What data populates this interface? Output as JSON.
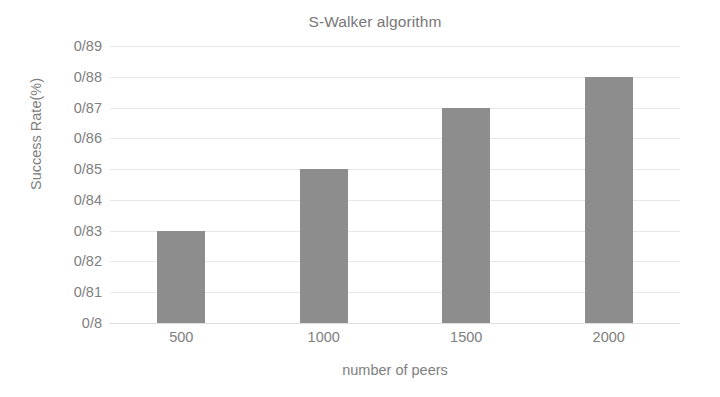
{
  "chart_data": {
    "type": "bar",
    "title": "S-Walker algorithm",
    "xlabel": "number of peers",
    "ylabel": "Success Rate(%)",
    "categories": [
      "500",
      "1000",
      "1500",
      "2000"
    ],
    "values": [
      0.83,
      0.85,
      0.87,
      0.88
    ],
    "value_labels": [
      "0/83",
      "0/85",
      "0/87",
      "0/88"
    ],
    "ylim": [
      0.8,
      0.89
    ],
    "ytick_values": [
      0.89,
      0.88,
      0.87,
      0.86,
      0.85,
      0.84,
      0.83,
      0.82,
      0.81,
      0.8
    ],
    "ytick_labels": [
      "0/89",
      "0/88",
      "0/87",
      "0/86",
      "0/85",
      "0/84",
      "0/83",
      "0/82",
      "0/81",
      "0/8"
    ],
    "grid": true,
    "grid_axis": "y",
    "legend": null,
    "legend_position": "none",
    "series": [
      {
        "name": "S-Walker",
        "values": [
          0.83,
          0.85,
          0.87,
          0.88
        ]
      }
    ],
    "colors": {
      "bar": "#8d8d8d",
      "grid": "#e8e8e8",
      "text": "#808080",
      "title": "#777777",
      "background": "#ffffff"
    }
  }
}
